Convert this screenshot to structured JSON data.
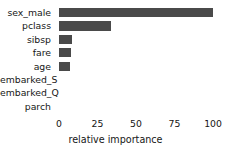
{
  "chart_data": {
    "type": "bar",
    "orientation": "horizontal",
    "title": "",
    "xlabel": "relative importance",
    "ylabel": "",
    "categories": [
      "sex_male",
      "pclass",
      "sibsp",
      "fare",
      "age",
      "embarked_S",
      "embarked_Q",
      "parch"
    ],
    "values": [
      100,
      34,
      8.5,
      7.5,
      7,
      0,
      0,
      0
    ],
    "xlim": [
      0,
      100
    ],
    "xticks": [
      0,
      25,
      50,
      75,
      100
    ],
    "xticklabels": [
      "0",
      "25",
      "50",
      "75",
      "100"
    ],
    "grid": false,
    "legend": null,
    "bar_color": "#4a4a4a",
    "background_color": "#ffffff"
  }
}
